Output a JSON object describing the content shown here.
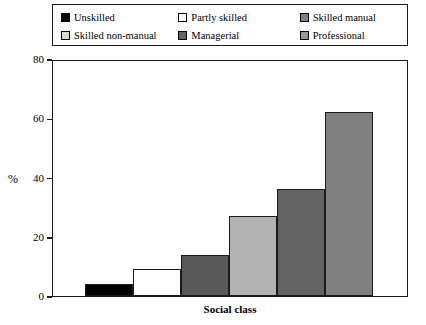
{
  "chart_data": {
    "type": "bar",
    "title": "",
    "xlabel": "Social class",
    "ylabel": "%",
    "ylim": [
      0,
      80
    ],
    "yticks": [
      0,
      20,
      40,
      60,
      80
    ],
    "grid": false,
    "legend_position": "top",
    "categories": [
      "Unskilled",
      "Partly skilled",
      "Skilled manual",
      "Skilled non-manual",
      "Managerial",
      "Professional"
    ],
    "values": [
      4,
      9,
      14,
      27,
      36,
      62
    ],
    "colors": [
      "#000000",
      "#ffffff",
      "#595959",
      "#b3b3b3",
      "#636363",
      "#808080"
    ]
  },
  "legend": {
    "entries": [
      {
        "label": "Unskilled",
        "color": "#000000"
      },
      {
        "label": "Partly skilled",
        "color": "#ffffff"
      },
      {
        "label": "Skilled manual",
        "color": "#808080"
      },
      {
        "label": "Skilled non-manual",
        "color": "#d9d9d9"
      },
      {
        "label": "Managerial",
        "color": "#636363"
      },
      {
        "label": "Professional",
        "color": "#999999"
      }
    ]
  },
  "axes": {
    "y_title": "%",
    "x_title": "Social class",
    "y_tick_labels": [
      "80",
      "60",
      "40",
      "20",
      "0"
    ]
  }
}
